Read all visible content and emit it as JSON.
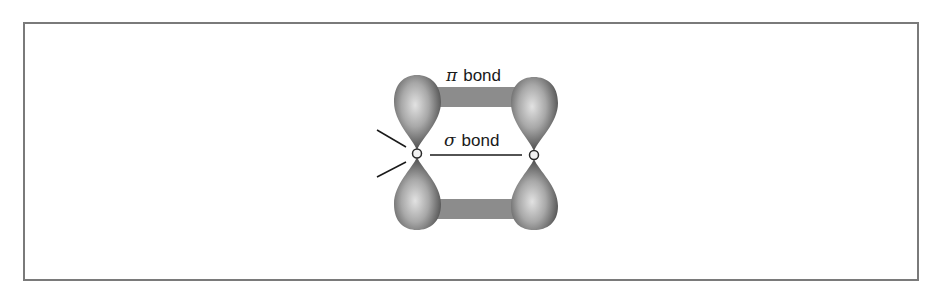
{
  "diagram": {
    "type": "orbital-bonding",
    "labels": {
      "pi_bond": {
        "symbol": "π",
        "text": "bond"
      },
      "sigma_bond": {
        "symbol": "σ",
        "text": "bond"
      }
    },
    "elements": [
      "left p-orbital (two lobes)",
      "right p-orbital (two lobes)",
      "top pi overlap bar",
      "bottom pi overlap bar",
      "sigma bond line between nuclei",
      "two substituent bond lines on left atom"
    ],
    "colors": {
      "border": "#7a7a7a",
      "bar": "#8c8c8c",
      "lobe_dark": "#3a3a3a",
      "lobe_light": "#d8d8d8",
      "text": "#1a1a1a"
    }
  }
}
